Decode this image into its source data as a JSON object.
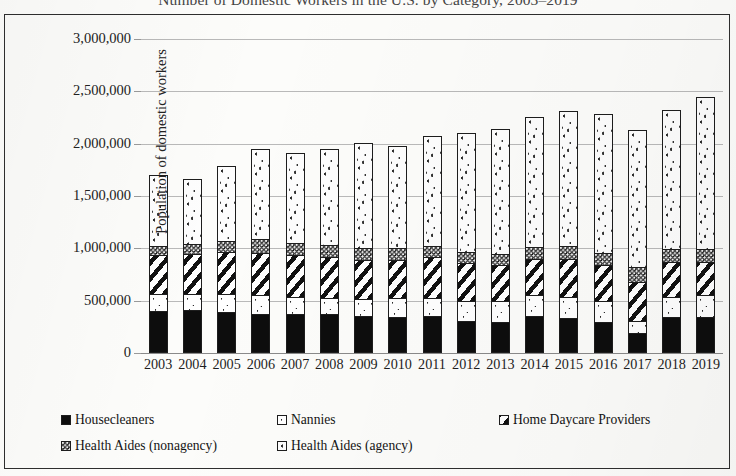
{
  "chart_data": {
    "type": "bar",
    "subtype": "stacked-bar",
    "title": "Number of Domestic Workers in the U.S. by Category, 2003–2019",
    "xlabel": "",
    "ylabel": "Population of domestic workers",
    "ylim": [
      0,
      3000000
    ],
    "ytick_labels": [
      "3,000,000",
      "2,500,000",
      "2,000,000",
      "1,500,000",
      "1,000,000",
      "500,000",
      "0"
    ],
    "ytick_values": [
      3000000,
      2500000,
      2000000,
      1500000,
      1000000,
      500000,
      0
    ],
    "grid": true,
    "legend_position": "bottom-left",
    "categories": [
      "2003",
      "2004",
      "2005",
      "2006",
      "2007",
      "2008",
      "2009",
      "2010",
      "2011",
      "2012",
      "2013",
      "2014",
      "2015",
      "2016",
      "2017",
      "2018",
      "2019"
    ],
    "series": [
      {
        "name": "Housecleaners",
        "pattern": "solid-black",
        "color": "#0d0d0d",
        "values": [
          400000,
          410000,
          390000,
          370000,
          370000,
          370000,
          350000,
          340000,
          350000,
          310000,
          300000,
          350000,
          330000,
          300000,
          190000,
          340000,
          340000
        ]
      },
      {
        "name": "Nannies",
        "pattern": "sparse-dots",
        "color": "#ffffff",
        "values": [
          160000,
          150000,
          170000,
          180000,
          170000,
          160000,
          170000,
          190000,
          180000,
          190000,
          200000,
          200000,
          210000,
          200000,
          120000,
          200000,
          210000
        ]
      },
      {
        "name": "Home Daycare Providers",
        "pattern": "diagonal-stripes",
        "color": "#ffffff",
        "values": [
          380000,
          390000,
          410000,
          410000,
          400000,
          390000,
          370000,
          360000,
          390000,
          360000,
          340000,
          350000,
          360000,
          340000,
          370000,
          330000,
          320000
        ]
      },
      {
        "name": "Health Aides (nonagency)",
        "pattern": "dense-speckle",
        "color": "#4a4a4a",
        "values": [
          80000,
          90000,
          100000,
          130000,
          110000,
          110000,
          110000,
          110000,
          100000,
          110000,
          110000,
          110000,
          120000,
          120000,
          140000,
          120000,
          120000
        ]
      },
      {
        "name": "Health Aides (agency)",
        "pattern": "scattered-dots",
        "color": "#fdfdfd",
        "values": [
          680000,
          620000,
          720000,
          860000,
          860000,
          920000,
          1010000,
          980000,
          1050000,
          1130000,
          1190000,
          1250000,
          1290000,
          1320000,
          1310000,
          1330000,
          1460000
        ]
      }
    ],
    "totals": [
      1700000,
      1660000,
      1790000,
      1950000,
      1910000,
      1950000,
      2010000,
      1980000,
      2070000,
      2100000,
      2140000,
      2260000,
      2310000,
      2280000,
      2130000,
      2320000,
      2450000
    ]
  },
  "axis": {
    "y_title": "Population of domestic workers"
  },
  "legend": {
    "rows": [
      [
        {
          "label": "Housecleaners",
          "swatch": "solid-black-swatch"
        },
        {
          "label": "Nannies",
          "swatch": "white-dot-swatch"
        },
        {
          "label": "Home Daycare Providers",
          "swatch": "diagonal-stripe-swatch"
        }
      ],
      [
        {
          "label": "Health Aides (nonagency)",
          "swatch": "dense-speckle-swatch"
        },
        {
          "label": "Health Aides (agency)",
          "swatch": "scattered-dot-swatch"
        }
      ]
    ]
  }
}
